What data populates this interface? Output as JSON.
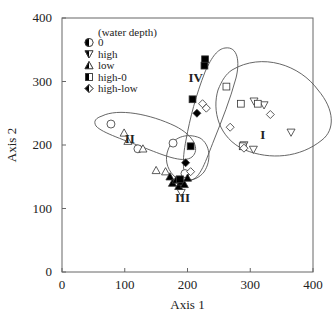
{
  "chart_data": {
    "type": "scatter",
    "title": "",
    "xlabel": "Axis 1",
    "ylabel": "Axis 2",
    "xlim": [
      0,
      400
    ],
    "ylim": [
      0,
      400
    ],
    "xticks": [
      "0",
      "100",
      "200",
      "300",
      "400"
    ],
    "yticks": [
      "0",
      "100",
      "200",
      "300",
      "400"
    ],
    "grid": false,
    "legend": {
      "title": "(water depth)",
      "position": "upper-left",
      "entries": [
        {
          "label": "0",
          "marker": "circle"
        },
        {
          "label": "high",
          "marker": "triangle-down"
        },
        {
          "label": "low",
          "marker": "triangle-up"
        },
        {
          "label": "high-0",
          "marker": "square"
        },
        {
          "label": "high-low",
          "marker": "diamond"
        }
      ]
    },
    "groups": [
      {
        "name": "I",
        "label_pos": [
          320,
          210
        ]
      },
      {
        "name": "II",
        "label_pos": [
          108,
          203
        ]
      },
      {
        "name": "III",
        "label_pos": [
          192,
          110
        ]
      },
      {
        "name": "IV",
        "label_pos": [
          213,
          300
        ]
      }
    ],
    "series": [
      {
        "name": "0",
        "marker": "circle",
        "points": [
          {
            "x": 78,
            "y": 233,
            "filled": false
          },
          {
            "x": 121,
            "y": 194,
            "filled": false
          },
          {
            "x": 177,
            "y": 203,
            "filled": false
          },
          {
            "x": 196,
            "y": 155,
            "filled": false
          }
        ]
      },
      {
        "name": "high",
        "marker": "triangle-down",
        "points": [
          {
            "x": 306,
            "y": 269,
            "filled": false
          },
          {
            "x": 322,
            "y": 263,
            "filled": false
          },
          {
            "x": 365,
            "y": 220,
            "filled": false
          },
          {
            "x": 290,
            "y": 200,
            "filled": false
          },
          {
            "x": 305,
            "y": 193,
            "filled": false
          },
          {
            "x": 190,
            "y": 125,
            "filled": false
          }
        ]
      },
      {
        "name": "low",
        "marker": "triangle-up",
        "points": [
          {
            "x": 99,
            "y": 219,
            "filled": false
          },
          {
            "x": 105,
            "y": 206,
            "filled": false
          },
          {
            "x": 129,
            "y": 194,
            "filled": false
          },
          {
            "x": 150,
            "y": 160,
            "filled": false
          },
          {
            "x": 165,
            "y": 158,
            "filled": false
          },
          {
            "x": 172,
            "y": 150,
            "filled": true
          },
          {
            "x": 176,
            "y": 140,
            "filled": true
          },
          {
            "x": 182,
            "y": 145,
            "filled": true
          },
          {
            "x": 186,
            "y": 135,
            "filled": true
          },
          {
            "x": 190,
            "y": 142,
            "filled": true
          },
          {
            "x": 195,
            "y": 138,
            "filled": true
          },
          {
            "x": 200,
            "y": 148,
            "filled": true
          }
        ]
      },
      {
        "name": "high-0",
        "marker": "square",
        "points": [
          {
            "x": 262,
            "y": 292,
            "filled": false
          },
          {
            "x": 285,
            "y": 265,
            "filled": false
          },
          {
            "x": 312,
            "y": 265,
            "filled": false
          },
          {
            "x": 288,
            "y": 198,
            "filled": false
          },
          {
            "x": 228,
            "y": 335,
            "filled": true
          },
          {
            "x": 227,
            "y": 325,
            "filled": true
          },
          {
            "x": 208,
            "y": 272,
            "filled": true
          },
          {
            "x": 205,
            "y": 198,
            "filled": true
          },
          {
            "x": 188,
            "y": 146,
            "filled": true
          }
        ]
      },
      {
        "name": "high-low",
        "marker": "diamond",
        "points": [
          {
            "x": 332,
            "y": 248,
            "filled": false
          },
          {
            "x": 268,
            "y": 228,
            "filled": false
          },
          {
            "x": 290,
            "y": 195,
            "filled": false
          },
          {
            "x": 224,
            "y": 265,
            "filled": false
          },
          {
            "x": 230,
            "y": 258,
            "filled": false
          },
          {
            "x": 215,
            "y": 250,
            "filled": true
          },
          {
            "x": 197,
            "y": 172,
            "filled": true
          },
          {
            "x": 205,
            "y": 158,
            "filled": false
          }
        ]
      }
    ]
  }
}
